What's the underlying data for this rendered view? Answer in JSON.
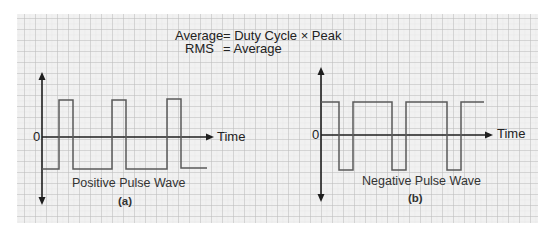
{
  "formulas": {
    "line1_left": "Average",
    "line1_right": "= Duty Cycle × Peak",
    "line2_left": "RMS",
    "line2_right": "= Average"
  },
  "panels": [
    {
      "id": "a",
      "title": "Positive Pulse Wave",
      "caption": "(a)",
      "zero_label": "0",
      "axis_label": "Time",
      "type": "positive",
      "axis_x": 42,
      "axis_top": 72,
      "axis_bottom": 205,
      "zero_y": 137,
      "high_y": 100,
      "low_y": 169,
      "time_arrow_end": 214,
      "path": [
        [
          42,
          169
        ],
        [
          59,
          169
        ],
        [
          59,
          100
        ],
        [
          73,
          100
        ],
        [
          73,
          169
        ],
        [
          112,
          169
        ],
        [
          112,
          100
        ],
        [
          126,
          100
        ],
        [
          126,
          169
        ],
        [
          167,
          169
        ],
        [
          167,
          99
        ],
        [
          181,
          99
        ],
        [
          181,
          168
        ],
        [
          207,
          168
        ]
      ]
    },
    {
      "id": "b",
      "title": "Negative Pulse Wave",
      "caption": "(b)",
      "zero_label": "0",
      "axis_label": "Time",
      "type": "negative",
      "axis_x": 321,
      "axis_top": 67,
      "axis_bottom": 202,
      "zero_y": 135,
      "high_y": 102,
      "low_y": 170,
      "time_arrow_end": 493,
      "path": [
        [
          321,
          102
        ],
        [
          339,
          102
        ],
        [
          339,
          170
        ],
        [
          353,
          170
        ],
        [
          353,
          102
        ],
        [
          392,
          102
        ],
        [
          392,
          170
        ],
        [
          406,
          170
        ],
        [
          406,
          102
        ],
        [
          447,
          102
        ],
        [
          447,
          170
        ],
        [
          461,
          170
        ],
        [
          461,
          102
        ],
        [
          484,
          102
        ]
      ]
    }
  ],
  "colors": {
    "grid_bg": "#f1f1f1",
    "grid_major": "#bdbdbd",
    "grid_minor": "#dcdcdc",
    "axis": "#1e1e1e",
    "wave": "#5a5a5a",
    "text": "#222222"
  }
}
